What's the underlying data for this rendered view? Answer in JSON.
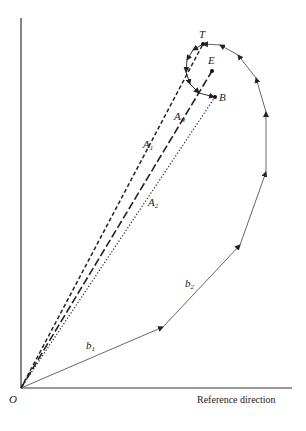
{
  "diagram": {
    "type": "phasor-diagram",
    "axis": {
      "origin_label": "O",
      "x_axis_label": "Reference direction"
    },
    "points": {
      "T": "T",
      "E": "E",
      "B": "B"
    },
    "vectors": {
      "A1": {
        "label": "A",
        "sub": "1",
        "style": "short-dashed"
      },
      "AR": {
        "label": "A",
        "sub": "R",
        "style": "long-dashed"
      },
      "A2": {
        "label": "A",
        "sub": "2",
        "style": "dotted"
      },
      "b1": {
        "label": "b",
        "sub": "1"
      },
      "b2": {
        "label": "b",
        "sub": "2"
      }
    },
    "colors": {
      "line": "#333333",
      "background": "#ffffff"
    }
  }
}
